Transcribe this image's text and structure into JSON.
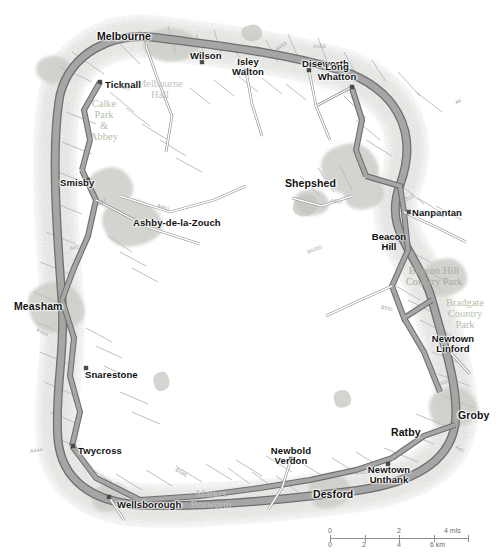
{
  "map": {
    "title": "National Forest area road map",
    "background_color": "#ffffff",
    "urban_tint": "#d8d8d4",
    "road_color": "#9a9a9a",
    "road_casing": "#6f6f6f",
    "minor_road_color": "#b8b8b8",
    "junction_marker_color": "#4a4a4a",
    "park_label_color": "#b9bdb6",
    "town_label_color": "#111111",
    "settlements": [
      {
        "name": "Melbourne",
        "x": 124,
        "y": 31,
        "style": "town big c",
        "dot": null
      },
      {
        "name": "Ticknall",
        "x": 105,
        "y": 80,
        "style": "town",
        "dot": [
          100,
          82
        ]
      },
      {
        "name": "Wilson",
        "x": 190,
        "y": 51,
        "style": "town",
        "dot": [
          202,
          62
        ]
      },
      {
        "name": "Isley\nWalton",
        "x": 248,
        "y": 57,
        "style": "town c",
        "dot": [
          246,
          71
        ]
      },
      {
        "name": "Diseworth",
        "x": 302,
        "y": 59,
        "style": "town",
        "dot": [
          309,
          70
        ]
      },
      {
        "name": "Long\nWhatton",
        "x": 337,
        "y": 62,
        "style": "town c",
        "dot": [
          352,
          87
        ]
      },
      {
        "name": "Shepshed",
        "x": 285,
        "y": 178,
        "style": "town big",
        "dot": null
      },
      {
        "name": "Nanpantan",
        "x": 412,
        "y": 208,
        "style": "town",
        "dot": [
          409,
          212
        ]
      },
      {
        "name": "Beacon\nHill",
        "x": 389,
        "y": 232,
        "style": "townb",
        "dot": null
      },
      {
        "name": "Newtown\nLinford",
        "x": 453,
        "y": 334,
        "style": "town c",
        "dot": [
          449,
          351
        ]
      },
      {
        "name": "Groby",
        "x": 458,
        "y": 410,
        "style": "town big",
        "dot": null
      },
      {
        "name": "Ratby",
        "x": 391,
        "y": 427,
        "style": "town big",
        "dot": null
      },
      {
        "name": "Newtown\nUnthank",
        "x": 389,
        "y": 465,
        "style": "town c",
        "dot": [
          388,
          464
        ]
      },
      {
        "name": "Desford",
        "x": 313,
        "y": 489,
        "style": "town big",
        "dot": null
      },
      {
        "name": "Newbold\nVerdon",
        "x": 291,
        "y": 446,
        "style": "town c",
        "dot": [
          291,
          459
        ]
      },
      {
        "name": "Wellsborough",
        "x": 117,
        "y": 500,
        "style": "town",
        "dot": [
          109,
          497
        ]
      },
      {
        "name": "Twycross",
        "x": 78,
        "y": 446,
        "style": "town",
        "dot": [
          73,
          446
        ]
      },
      {
        "name": "Snarestone",
        "x": 85,
        "y": 370,
        "style": "town",
        "dot": [
          86,
          368
        ]
      },
      {
        "name": "Measham",
        "x": 14,
        "y": 301,
        "style": "town big",
        "dot": null
      },
      {
        "name": "Smisby",
        "x": 60,
        "y": 178,
        "style": "town",
        "dot": [
          88,
          180
        ]
      },
      {
        "name": "Ashby-de-la-Zouch",
        "x": 133,
        "y": 218,
        "style": "town",
        "dot": null
      }
    ],
    "area_labels": [
      {
        "name": "Melbourne\nHall",
        "x": 160,
        "y": 78,
        "style": "park grey"
      },
      {
        "name": "Calke\nPark\n&\nAbbey",
        "x": 104,
        "y": 98,
        "style": "park green"
      },
      {
        "name": "Beacon Hill\nCountry Park",
        "x": 434,
        "y": 265,
        "style": "park dk"
      },
      {
        "name": "Bradgate\nCountry\nPark",
        "x": 465,
        "y": 297,
        "style": "park green"
      },
      {
        "name": "Market\nBosworth",
        "x": 211,
        "y": 488,
        "style": "park grey"
      }
    ],
    "road_shields": [
      {
        "label": "A453",
        "x": 275,
        "y": 44
      },
      {
        "label": "A453",
        "x": 313,
        "y": 44
      },
      {
        "label": "A6",
        "x": 455,
        "y": 99
      },
      {
        "label": "A512",
        "x": 330,
        "y": 199
      },
      {
        "label": "A512",
        "x": 402,
        "y": 196
      },
      {
        "label": "B591",
        "x": 432,
        "y": 212
      },
      {
        "label": "B5350",
        "x": 307,
        "y": 247
      },
      {
        "label": "B591",
        "x": 381,
        "y": 306
      },
      {
        "label": "A50",
        "x": 440,
        "y": 380
      },
      {
        "label": "A511",
        "x": 119,
        "y": 85
      },
      {
        "label": "B587",
        "x": 94,
        "y": 200
      },
      {
        "label": "A453",
        "x": 157,
        "y": 205
      },
      {
        "label": "A42",
        "x": 70,
        "y": 245
      },
      {
        "label": "A444",
        "x": 36,
        "y": 330
      },
      {
        "label": "A444",
        "x": 30,
        "y": 448
      },
      {
        "label": "B585",
        "x": 175,
        "y": 470
      },
      {
        "label": "B582",
        "x": 356,
        "y": 470
      },
      {
        "label": "A47",
        "x": 455,
        "y": 447
      }
    ]
  },
  "scale": {
    "miles_unit": "mls",
    "km_unit": "km",
    "miles_ticks": [
      "0",
      "2",
      "4"
    ],
    "km_ticks": [
      "0",
      "2",
      "4",
      "6"
    ],
    "miles_label": "4 mls",
    "km_label": "6 km"
  }
}
